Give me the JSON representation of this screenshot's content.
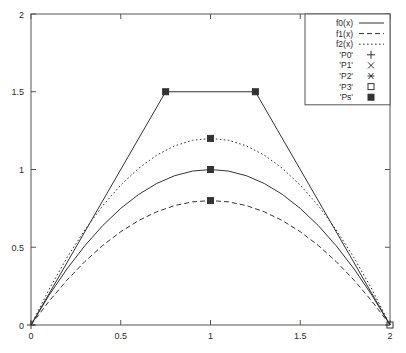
{
  "chart_data": {
    "type": "line",
    "title": "",
    "xlabel": "",
    "ylabel": "",
    "xlim": [
      0,
      2
    ],
    "ylim": [
      0,
      2
    ],
    "xticks": [
      "0",
      "0.5",
      "1",
      "1.5",
      "2"
    ],
    "xtick_values": [
      0,
      0.5,
      1,
      1.5,
      2
    ],
    "yticks": [
      "0",
      "0.5",
      "1",
      "1.5",
      "2"
    ],
    "ytick_values": [
      0,
      0.5,
      1,
      1.5,
      2
    ],
    "grid": false,
    "legend_position": "top-right",
    "series": [
      {
        "name": "f0(x)",
        "style": "solid",
        "peak": {
          "x": 1,
          "y": 1.0
        },
        "x": [
          0,
          0.1,
          0.2,
          0.3,
          0.4,
          0.5,
          0.6,
          0.7,
          0.8,
          0.9,
          1.0,
          1.1,
          1.2,
          1.3,
          1.4,
          1.5,
          1.6,
          1.7,
          1.8,
          1.9,
          2.0
        ],
        "values": [
          0,
          0.19,
          0.36,
          0.51,
          0.64,
          0.75,
          0.84,
          0.91,
          0.96,
          0.99,
          1.0,
          0.99,
          0.96,
          0.91,
          0.84,
          0.75,
          0.64,
          0.51,
          0.36,
          0.19,
          0
        ]
      },
      {
        "name": "f1(x)",
        "style": "dashed",
        "peak": {
          "x": 1,
          "y": 0.8
        },
        "x": [
          0,
          0.1,
          0.2,
          0.3,
          0.4,
          0.5,
          0.6,
          0.7,
          0.8,
          0.9,
          1.0,
          1.1,
          1.2,
          1.3,
          1.4,
          1.5,
          1.6,
          1.7,
          1.8,
          1.9,
          2.0
        ],
        "values": [
          0,
          0.152,
          0.288,
          0.408,
          0.512,
          0.6,
          0.672,
          0.728,
          0.768,
          0.792,
          0.8,
          0.792,
          0.768,
          0.728,
          0.672,
          0.6,
          0.512,
          0.408,
          0.288,
          0.152,
          0
        ]
      },
      {
        "name": "f2(x)",
        "style": "dotted",
        "peak": {
          "x": 1,
          "y": 1.2
        },
        "x": [
          0,
          0.1,
          0.2,
          0.3,
          0.4,
          0.5,
          0.6,
          0.7,
          0.8,
          0.9,
          1.0,
          1.1,
          1.2,
          1.3,
          1.4,
          1.5,
          1.6,
          1.7,
          1.8,
          1.9,
          2.0
        ],
        "values": [
          0,
          0.228,
          0.432,
          0.612,
          0.768,
          0.9,
          1.008,
          1.092,
          1.152,
          1.188,
          1.2,
          1.188,
          1.152,
          1.092,
          1.008,
          0.9,
          0.768,
          0.612,
          0.432,
          0.228,
          0
        ]
      },
      {
        "name": "control-polygon",
        "style": "solid",
        "x": [
          0,
          0.75,
          1.25,
          2.0
        ],
        "values": [
          0,
          1.5,
          1.5,
          0
        ]
      }
    ],
    "point_sets": [
      {
        "name": "'P0'",
        "marker": "plus",
        "points": [
          {
            "x": 0,
            "y": 0
          }
        ]
      },
      {
        "name": "'P1'",
        "marker": "cross",
        "points": [
          {
            "x": 0.75,
            "y": 1.5
          }
        ]
      },
      {
        "name": "'P2'",
        "marker": "star",
        "points": [
          {
            "x": 1.25,
            "y": 1.5
          }
        ]
      },
      {
        "name": "'P3'",
        "marker": "open-square",
        "points": [
          {
            "x": 2,
            "y": 0
          }
        ]
      },
      {
        "name": "'Ps'",
        "marker": "filled-square",
        "points": [
          {
            "x": 1,
            "y": 1.2
          },
          {
            "x": 1,
            "y": 1.0
          },
          {
            "x": 1,
            "y": 0.8
          },
          {
            "x": 0.75,
            "y": 1.5
          },
          {
            "x": 1.25,
            "y": 1.5
          }
        ]
      }
    ],
    "legend_entries": [
      {
        "label": "f0(x)",
        "kind": "line",
        "style": "solid"
      },
      {
        "label": "f1(x)",
        "kind": "line",
        "style": "dashed"
      },
      {
        "label": "f2(x)",
        "kind": "line",
        "style": "dotted"
      },
      {
        "label": "'P0'",
        "kind": "marker",
        "marker": "plus"
      },
      {
        "label": "'P1'",
        "kind": "marker",
        "marker": "cross"
      },
      {
        "label": "'P2'",
        "kind": "marker",
        "marker": "star"
      },
      {
        "label": "'P3'",
        "kind": "marker",
        "marker": "open-square"
      },
      {
        "label": "'Ps'",
        "kind": "marker",
        "marker": "filled-square"
      }
    ],
    "colors": {
      "line": "#333333",
      "axis": "#555555",
      "text": "#2b2b2b",
      "background": "#ffffff"
    }
  }
}
